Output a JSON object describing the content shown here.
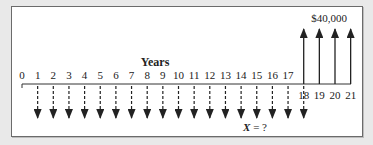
{
  "diagram": {
    "axis_label": "Years",
    "periods": [
      "0",
      "1",
      "2",
      "3",
      "4",
      "5",
      "6",
      "7",
      "8",
      "9",
      "10",
      "11",
      "12",
      "13",
      "14",
      "15",
      "16",
      "17",
      "18",
      "19",
      "20",
      "21"
    ],
    "outflows": {
      "periods": [
        1,
        2,
        3,
        4,
        5,
        6,
        7,
        8,
        9,
        10,
        11,
        12,
        13,
        14,
        15,
        16,
        17,
        18
      ],
      "label": "X = ?",
      "label_var": "X",
      "label_rest": " = ?",
      "style": "dashed-down-arrow"
    },
    "inflows": {
      "periods": [
        18,
        19,
        20,
        21
      ],
      "label": "$40,000",
      "style": "solid-up-arrow"
    },
    "colors": {
      "background": "#e9e9e9",
      "panel": "#ffffff",
      "ink": "#222222",
      "border": "#6b6b6b"
    }
  }
}
